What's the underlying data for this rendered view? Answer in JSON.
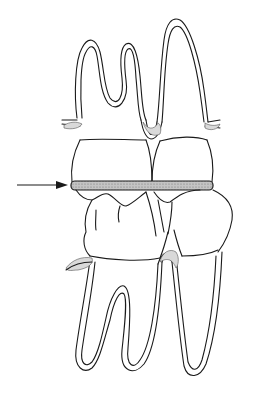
{
  "figure": {
    "subject": "Occluding maxillary and mandibular molars with interocclusal shim",
    "colors": {
      "line": "#1a1a1a",
      "shim_fill": "#b8b8b8",
      "background": "#ffffff"
    },
    "elements": {
      "upper_teeth": "maxillary-molars",
      "lower_teeth": "mandibular-molars",
      "shim": "interocclusal-strip",
      "arrow": "pointer-arrow"
    }
  }
}
